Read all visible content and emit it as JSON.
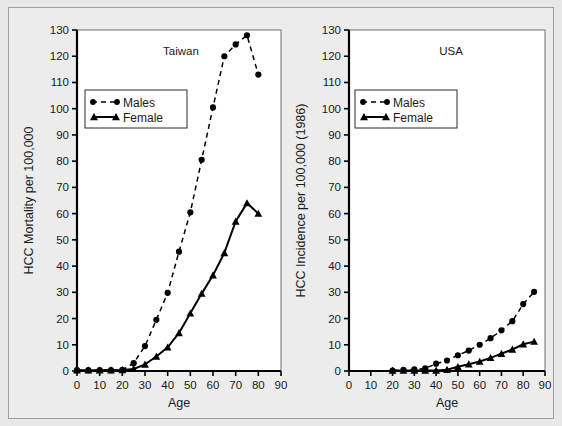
{
  "figure": {
    "background_color": "#e8e8e8",
    "frame_color": "#9aa0a6",
    "panel_background": "#ffffff"
  },
  "chart_data": [
    {
      "type": "line",
      "title": "Taiwan",
      "xlabel": "Age",
      "ylabel": "HCC Mortality per 100,000",
      "xlim": [
        0,
        90
      ],
      "ylim": [
        0,
        130
      ],
      "xticks": [
        0,
        10,
        20,
        30,
        40,
        50,
        60,
        70,
        80,
        90
      ],
      "yticks": [
        0,
        10,
        20,
        30,
        40,
        50,
        60,
        70,
        80,
        90,
        100,
        110,
        120,
        130
      ],
      "grid": false,
      "legend_position": "upper left",
      "series": [
        {
          "name": "Males",
          "marker": "circle",
          "linestyle": "dashed",
          "color": "#000000",
          "x": [
            0,
            5,
            10,
            15,
            20,
            25,
            30,
            35,
            40,
            45,
            50,
            55,
            60,
            65,
            70,
            75,
            80
          ],
          "values": [
            0.3,
            0.3,
            0.3,
            0.3,
            0.4,
            3.0,
            9.5,
            19.5,
            29.8,
            45.5,
            60.5,
            80.5,
            100.5,
            120.0,
            124.5,
            128.0,
            113.0
          ]
        },
        {
          "name": "Female",
          "marker": "triangle",
          "linestyle": "solid",
          "color": "#000000",
          "x": [
            0,
            5,
            10,
            15,
            20,
            25,
            30,
            35,
            40,
            45,
            50,
            55,
            60,
            65,
            70,
            75,
            80
          ],
          "values": [
            0.3,
            0.3,
            0.3,
            0.3,
            0.4,
            0.8,
            2.5,
            5.5,
            9.0,
            14.5,
            22.0,
            29.5,
            36.5,
            45.0,
            57.0,
            64.0,
            60.0
          ]
        }
      ]
    },
    {
      "type": "line",
      "title": "USA",
      "xlabel": "Age",
      "ylabel": "HCC Incidence per 100,000 (1986)",
      "xlim": [
        0,
        90
      ],
      "ylim": [
        0,
        130
      ],
      "xticks": [
        0,
        10,
        20,
        30,
        40,
        50,
        60,
        70,
        80,
        90
      ],
      "yticks": [
        0,
        10,
        20,
        30,
        40,
        50,
        60,
        70,
        80,
        90,
        100,
        110,
        120,
        130
      ],
      "grid": false,
      "legend_position": "upper left",
      "series": [
        {
          "name": "Males",
          "marker": "circle",
          "linestyle": "dashed",
          "color": "#000000",
          "x": [
            20,
            25,
            30,
            35,
            40,
            45,
            50,
            55,
            60,
            65,
            70,
            75,
            80,
            85
          ],
          "values": [
            0.2,
            0.4,
            0.6,
            1.0,
            2.8,
            4.0,
            6.0,
            7.8,
            10.0,
            12.5,
            15.5,
            19.0,
            25.5,
            30.2
          ]
        },
        {
          "name": "Female",
          "marker": "triangle",
          "linestyle": "solid",
          "color": "#000000",
          "x": [
            20,
            25,
            30,
            35,
            40,
            45,
            50,
            55,
            60,
            65,
            70,
            75,
            80,
            85
          ],
          "values": [
            0.2,
            0.2,
            0.2,
            0.2,
            0.2,
            0.5,
            1.6,
            2.6,
            3.6,
            5.0,
            6.6,
            8.2,
            10.2,
            11.2
          ]
        }
      ]
    }
  ],
  "legend": {
    "males_label": "Males",
    "female_label": "Female"
  },
  "icons": {
    "male_marker": "filled-circle-marker",
    "female_marker": "filled-triangle-marker"
  }
}
